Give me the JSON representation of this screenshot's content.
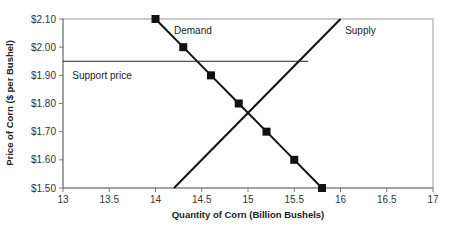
{
  "chart_data": {
    "type": "line",
    "title": "",
    "xlabel": "Quantity of Corn (Billion Bushels)",
    "ylabel": "Price of Corn ($ per Bushel)",
    "xlim": [
      13,
      17
    ],
    "ylim": [
      1.5,
      2.1
    ],
    "x_ticks": [
      "13",
      "13.5",
      "14",
      "14.5",
      "15",
      "15.5",
      "16",
      "16.5",
      "17"
    ],
    "y_ticks": [
      "$1.50",
      "$1.60",
      "$1.70",
      "$1.80",
      "$1.90",
      "$2.00",
      "$2.10"
    ],
    "grid": false,
    "legend": "none",
    "series": [
      {
        "name": "Demand",
        "marker": "square",
        "color": "#111111",
        "x": [
          14.0,
          14.3,
          14.6,
          14.9,
          15.2,
          15.5,
          15.8
        ],
        "y": [
          2.1,
          2.0,
          1.9,
          1.8,
          1.7,
          1.6,
          1.5
        ]
      },
      {
        "name": "Supply",
        "marker": "none",
        "color": "#111111",
        "x": [
          14.2,
          16.0
        ],
        "y": [
          1.5,
          2.1
        ]
      },
      {
        "name": "Support price",
        "marker": "none",
        "color": "#111111",
        "x": [
          13.0,
          15.65
        ],
        "y": [
          1.95,
          1.95
        ]
      }
    ],
    "annotations": [
      {
        "text": "Demand",
        "x": 14.2,
        "y": 2.06
      },
      {
        "text": "Supply",
        "x": 16.05,
        "y": 2.06
      },
      {
        "text": "Support price",
        "x": 13.1,
        "y": 1.9
      }
    ]
  }
}
